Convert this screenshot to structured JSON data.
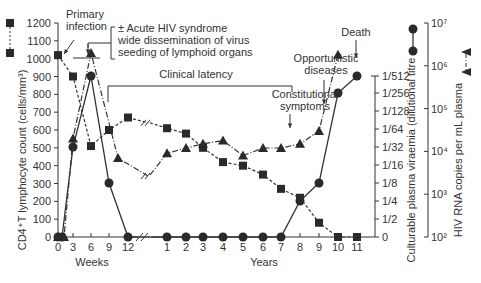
{
  "chart_data": {
    "type": "line",
    "title": "",
    "xlabel_left": "Weeks",
    "xlabel_right": "Years",
    "x_ticks_weeks": [
      "0",
      "3",
      "6",
      "9",
      "12"
    ],
    "x_ticks_years": [
      "1",
      "2",
      "3",
      "4",
      "5",
      "6",
      "7",
      "8",
      "9",
      "10",
      "11"
    ],
    "ylabel_left": "CD4⁺T lymphocyte count (cells/mm³)",
    "ylim_left": [
      0,
      1200
    ],
    "y_ticks_left": [
      "0",
      "100",
      "200",
      "300",
      "400",
      "500",
      "600",
      "700",
      "800",
      "900",
      "1000",
      "1100",
      "1200"
    ],
    "ylabel_right1": "Culturable plasma viraemia (dilutional titre",
    "y_ticks_right1": [
      "0",
      "1/2",
      "1/4",
      "1/8",
      "1/16",
      "1/32",
      "1/64",
      "1/128",
      "1/256",
      "1/512"
    ],
    "ylabel_right2": "HIV RNA copies per mL plasma",
    "y_ticks_right2": [
      "10²",
      "10³",
      "10⁴",
      "10⁵",
      "10⁶",
      "10⁷"
    ],
    "legend": [
      {
        "name": "CD4+T lymphocyte count",
        "marker": "square",
        "line": "dashed",
        "axis": "left"
      },
      {
        "name": "Culturable plasma viraemia",
        "marker": "circle",
        "line": "solid",
        "axis": "right1"
      },
      {
        "name": "HIV RNA copies per mL plasma",
        "marker": "triangle",
        "line": "dash-dot",
        "axis": "right2"
      }
    ],
    "series": [
      {
        "name": "CD4+T lymphocyte count",
        "x": [
          "0w",
          "3w",
          "6w",
          "9w",
          "12w",
          "1y",
          "2y",
          "3y",
          "4y",
          "5y",
          "6y",
          "7y",
          "8y",
          "9y",
          "10y",
          "11y"
        ],
        "values": [
          1020,
          900,
          510,
          600,
          670,
          610,
          580,
          500,
          420,
          400,
          350,
          270,
          220,
          80,
          0,
          0
        ]
      },
      {
        "name": "Culturable plasma viraemia (dilutional titre)",
        "x": [
          "0w",
          "0.5w",
          "3w",
          "6w",
          "9w",
          "12w",
          "1y",
          "2y",
          "3y",
          "4y",
          "5y",
          "6y",
          "7y",
          "8y",
          "9y",
          "10y",
          "11y"
        ],
        "values": [
          "0",
          "0",
          "1/32",
          "1/512",
          "1/8",
          "0",
          "0",
          "0",
          "0",
          "0",
          "0",
          "0",
          "0",
          "1/4",
          "1/8",
          "1/256",
          "1/512"
        ]
      },
      {
        "name": "HIV RNA copies per mL plasma",
        "x": [
          "0w",
          "1w",
          "3w",
          "6w",
          "9w",
          "1y",
          "2y",
          "3y",
          "4y",
          "5y",
          "6y",
          "7y",
          "8y",
          "9y",
          "10y"
        ],
        "values": [
          100,
          100,
          20000,
          2000000,
          7000,
          9000,
          12000,
          15000,
          18000,
          8000,
          12000,
          12000,
          15000,
          30000,
          1800000
        ]
      }
    ],
    "annotations": [
      {
        "text": "Primary infection",
        "at": "0w"
      },
      {
        "text": "± Acute HIV syndrome",
        "line2": "wide dissemination of virus",
        "line3": "seeding of lymphoid organs",
        "at": "3-6w"
      },
      {
        "text": "Clinical latency",
        "range": "9w-7.5y"
      },
      {
        "text": "Constitutional symptoms",
        "at": "7.5y"
      },
      {
        "text": "Opportunistic diseases",
        "at": "8.5y"
      },
      {
        "text": "Death",
        "at": "11y"
      }
    ],
    "grid": false
  },
  "labels": {
    "primary1": "Primary",
    "primary2": "infection",
    "acute1": "± Acute HIV syndrome",
    "acute2": "wide dissemination of virus",
    "acute3": "seeding of lymphoid organs",
    "latency": "Clinical latency",
    "constit1": "Constitutional",
    "constit2": "symptoms",
    "opp1": "Opportunistic",
    "opp2": "diseases",
    "death": "Death",
    "weeks": "Weeks",
    "years": "Years",
    "ylabel_left": "CD4⁺T lymphocyte count (cells/mm³)",
    "ylabel_r1": "Culturable plasma viraemia (dilutional titre",
    "ylabel_r2": "HIV RNA copies per mL plasma"
  }
}
